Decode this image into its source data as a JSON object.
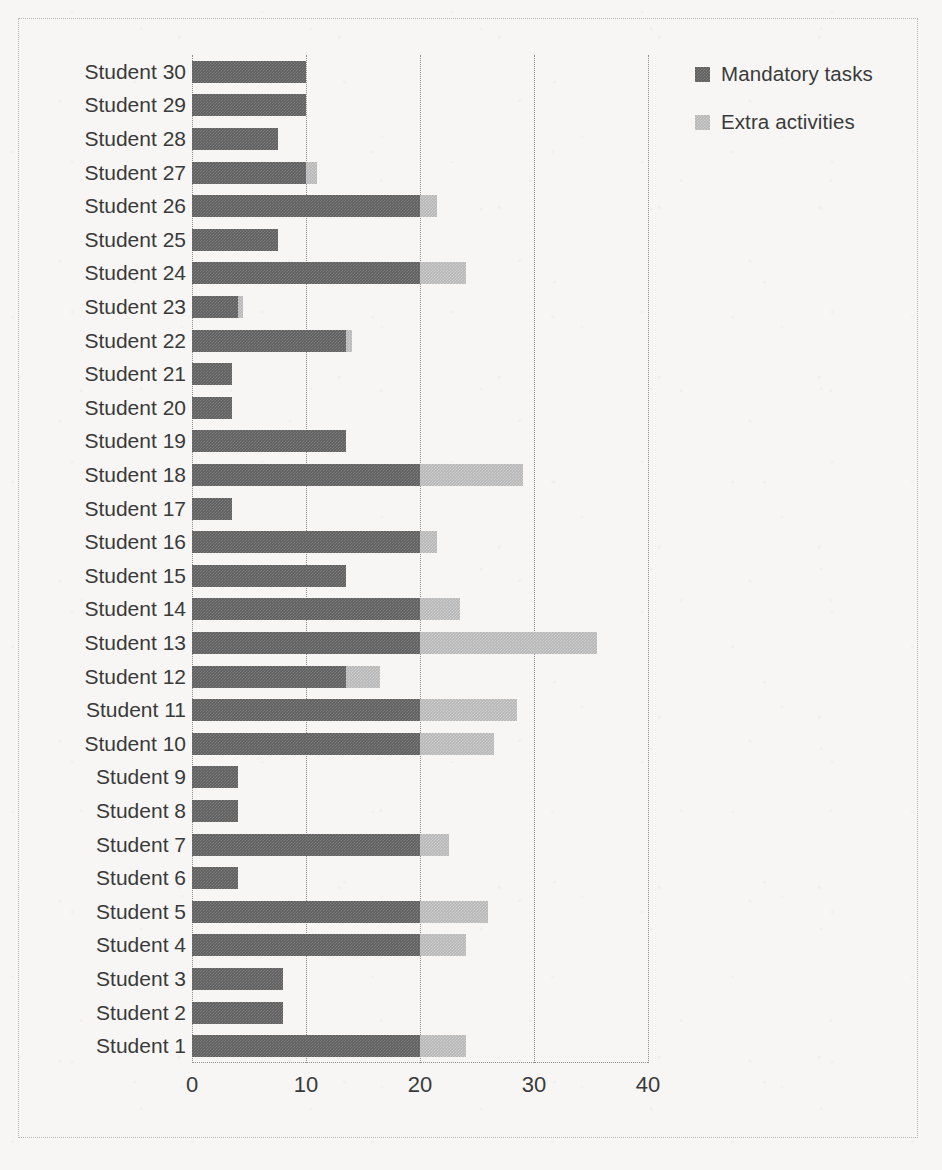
{
  "chart_data": {
    "type": "bar",
    "orientation": "horizontal",
    "stacked": true,
    "title": "",
    "subtitle": "",
    "xlabel": "",
    "ylabel": "",
    "xlim": [
      0,
      40
    ],
    "xticks": [
      0,
      10,
      20,
      30,
      40
    ],
    "xtick_labels": [
      "0",
      "10",
      "20",
      "30",
      "40"
    ],
    "grid": "vertical-only",
    "legend_position": "top-right",
    "categories": [
      "Student 30",
      "Student 29",
      "Student 28",
      "Student 27",
      "Student 26",
      "Student 25",
      "Student 24",
      "Student 23",
      "Student 22",
      "Student 21",
      "Student 20",
      "Student 19",
      "Student 18",
      "Student 17",
      "Student 16",
      "Student 15",
      "Student 14",
      "Student 13",
      "Student 12",
      "Student 11",
      "Student 10",
      "Student 9",
      "Student 8",
      "Student 7",
      "Student 6",
      "Student 5",
      "Student 4",
      "Student 3",
      "Student 2",
      "Student 1"
    ],
    "series": [
      {
        "name": "Mandatory tasks",
        "color": "#5f5f5f",
        "values": [
          10,
          10,
          7.5,
          10,
          20,
          7.5,
          20,
          4,
          13.5,
          3.5,
          3.5,
          13.5,
          20,
          3.5,
          20,
          13.5,
          20,
          20,
          13.5,
          20,
          20,
          4,
          4,
          20,
          4,
          20,
          20,
          8,
          8,
          20
        ]
      },
      {
        "name": "Extra activities",
        "color": "#b6b6b6",
        "values": [
          0,
          0,
          0,
          1,
          1.5,
          0,
          4,
          0.5,
          0.5,
          0,
          0,
          0,
          9,
          0,
          1.5,
          0,
          3.5,
          15.5,
          3,
          8.5,
          6.5,
          0,
          0,
          2.5,
          0,
          6,
          4,
          0,
          0,
          4
        ]
      }
    ],
    "totals": [
      10,
      10,
      7.5,
      11,
      21.5,
      7.5,
      24,
      4.5,
      14,
      3.5,
      3.5,
      13.5,
      29,
      3.5,
      21.5,
      13.5,
      23.5,
      35.5,
      16.5,
      28.5,
      26.5,
      4,
      4,
      22.5,
      4,
      26,
      24,
      8,
      8,
      24
    ]
  },
  "legend": {
    "items": [
      {
        "label": "Mandatory tasks",
        "color": "#5f5f5f"
      },
      {
        "label": "Extra activities",
        "color": "#b6b6b6"
      }
    ]
  },
  "colors": {
    "mandatory": "#5f5f5f",
    "extra": "#b6b6b6",
    "gridline": "#8d8d8d",
    "frame": "#b9b6b2",
    "text": "#3a3a3a",
    "background": "#f7f6f4"
  }
}
